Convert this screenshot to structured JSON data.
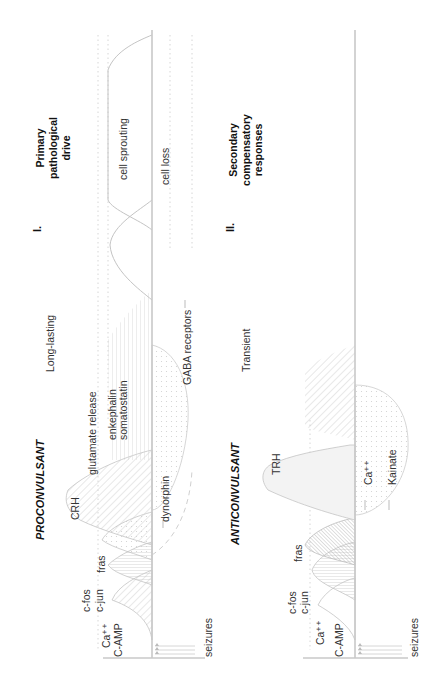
{
  "figure": {
    "orientation": "rotated-90-ccw",
    "panel_I": {
      "numeral": "I.",
      "heading_lines": [
        "Primary",
        "pathological",
        "drive"
      ],
      "category": "PROCONVULSANT",
      "duration": "Long-lasting",
      "above_axis_labels": {
        "ca": "Ca⁺⁺",
        "camp": "C-AMP",
        "cfos": "c-fos",
        "cjun": "c-jun",
        "fras": "fras",
        "crh": "CRH",
        "glutamate": "glutamate release",
        "enkephalin": "enkephalin",
        "somatostatin": "somatostatin",
        "cell_sprouting": "cell sprouting"
      },
      "below_axis_labels": {
        "dynorphin": "dynorphin",
        "gaba": "GABA receptors",
        "cell_loss": "cell loss"
      },
      "trigger": "seizures"
    },
    "panel_II": {
      "numeral": "II.",
      "heading_lines": [
        "Secondary",
        "compensatory",
        "responses"
      ],
      "category": "ANTICONVULSANT",
      "duration": "Transient",
      "above_axis_labels": {
        "ca": "Ca⁺⁺",
        "camp": "C-AMP",
        "cfos": "c-fos",
        "cjun": "c-jun",
        "fras": "fras",
        "trh": "TRH"
      },
      "below_axis_labels": {
        "ca": "Ca⁺⁺",
        "kainate": "Kainate"
      },
      "trigger": "seizures"
    },
    "colors": {
      "axis": "#c8c8c8",
      "curve": "#c4c4c4",
      "hatch": "#cfcfcf",
      "text": "#333333",
      "heading": "#111111"
    }
  }
}
